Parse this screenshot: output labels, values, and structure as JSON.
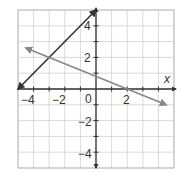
{
  "chart_data": {
    "type": "line",
    "title": "",
    "xlabel": "x",
    "ylabel": "",
    "xlim": [
      -5,
      5
    ],
    "ylim": [
      -5,
      5
    ],
    "grid": true,
    "x_ticks": [
      -4,
      -2,
      0,
      2
    ],
    "y_ticks": [
      4,
      2,
      -2,
      -4
    ],
    "origin_label": "0",
    "series": [
      {
        "name": "line-1",
        "equation": "y = x + 5",
        "color": "#333333",
        "points": [
          [
            -5,
            0
          ],
          [
            0,
            5
          ]
        ],
        "arrows": "both"
      },
      {
        "name": "line-2",
        "equation": "y = -0.4x + 0.8",
        "color": "#888888",
        "points": [
          [
            -4.5,
            2.6
          ],
          [
            4.5,
            -1.0
          ]
        ],
        "arrows": "both"
      }
    ],
    "intersection": [
      -3,
      2
    ]
  },
  "labels": {
    "x_axis": "x",
    "origin": "0",
    "x_ticks": [
      "−4",
      "−2",
      "2"
    ],
    "y_ticks": [
      "4",
      "2",
      "−2",
      "−4"
    ]
  },
  "colors": {
    "grid": "#cfcfcf",
    "axis": "#333333",
    "line_dark": "#333333",
    "line_gray": "#888888",
    "frame": "#bdbdbd"
  }
}
